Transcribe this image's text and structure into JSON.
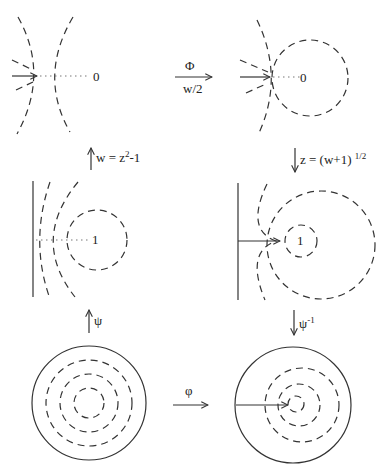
{
  "diagram": {
    "panels": {
      "top_left": {
        "point_label": "0"
      },
      "top_right": {
        "point_label": "0"
      },
      "middle_left": {
        "point_label": "1"
      },
      "middle_right": {
        "point_label": "1"
      },
      "bottom_left": {},
      "bottom_right": {}
    },
    "maps": {
      "top_horizontal": {
        "symbol": "Φ",
        "sub_label": "w/2",
        "direction": "right"
      },
      "left_upper_vertical": {
        "label_w": "w = z",
        "label_exp": "2",
        "label_tail": "-1",
        "direction": "up"
      },
      "right_upper_vertical": {
        "label": "z = (w+1)",
        "label_exp": "1/2",
        "direction": "down"
      },
      "left_lower_vertical": {
        "symbol": "ψ",
        "direction": "up"
      },
      "right_lower_vertical": {
        "symbol": "ψ",
        "label_exp": "-1",
        "direction": "down"
      },
      "bottom_horizontal": {
        "symbol": "φ",
        "direction": "right"
      }
    },
    "colors": {
      "stroke": "#333333",
      "dotted": "#777777",
      "background": "#ffffff"
    }
  }
}
